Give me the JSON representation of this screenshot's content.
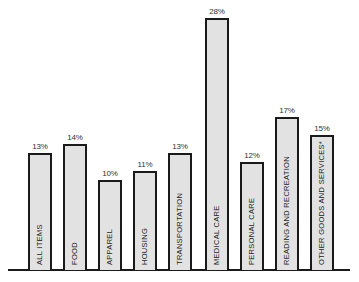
{
  "chart_data": {
    "type": "bar",
    "title": "",
    "xlabel": "",
    "ylabel": "",
    "ylim": [
      0,
      30
    ],
    "grid": false,
    "legend": null,
    "value_suffix": "%",
    "categories": [
      "ALL ITEMS",
      "FOOD",
      "APPAREL",
      "HOUSING",
      "TRANSPORTATION",
      "MEDICAL CARE",
      "PERSONAL CARE",
      "READING AND RECREATION",
      "OTHER GOODS AND SERVICES*"
    ],
    "values": [
      13,
      14,
      10,
      11,
      13,
      28,
      12,
      17,
      15
    ],
    "value_labels": [
      "13%",
      "14%",
      "10%",
      "11%",
      "13%",
      "28%",
      "12%",
      "17%",
      "15%"
    ]
  },
  "layout": {
    "bar_lefts": [
      28,
      63,
      98,
      133,
      168,
      205,
      240,
      275,
      310
    ],
    "bar_width": 24,
    "baseline_y": 270,
    "px_per_unit": 9
  }
}
